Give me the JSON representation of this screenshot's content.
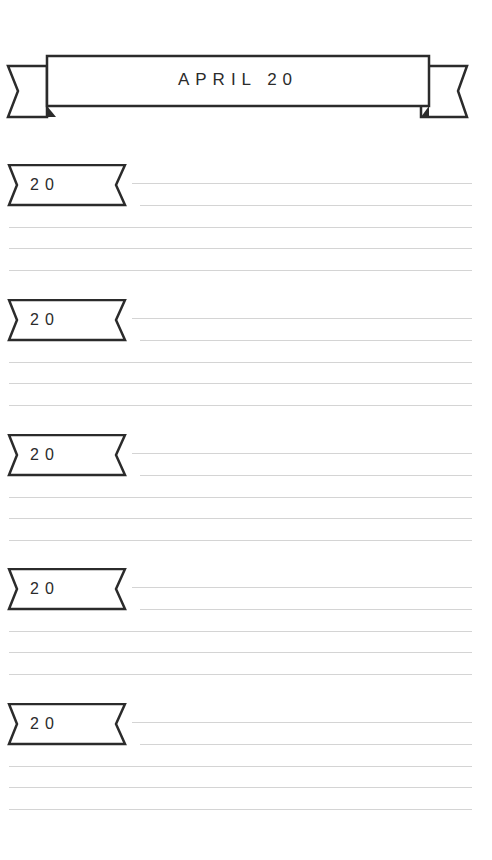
{
  "header": {
    "title": "APRIL 20"
  },
  "days": [
    {
      "label": "20",
      "top": 164
    },
    {
      "label": "20",
      "top": 299
    },
    {
      "label": "20",
      "top": 434
    },
    {
      "label": "20",
      "top": 568
    },
    {
      "label": "20",
      "top": 703
    }
  ],
  "colors": {
    "ink": "#2b2b2b",
    "rule": "#d4d4d4",
    "paper": "#ffffff"
  }
}
